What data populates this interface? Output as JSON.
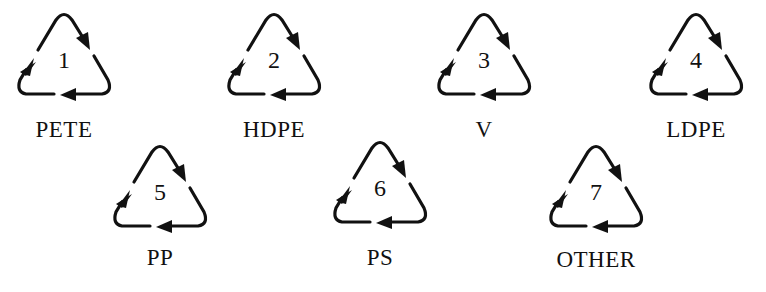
{
  "symbols": [
    {
      "number": "1",
      "label": "PETE"
    },
    {
      "number": "2",
      "label": "HDPE"
    },
    {
      "number": "3",
      "label": "V"
    },
    {
      "number": "4",
      "label": "LDPE"
    },
    {
      "number": "5",
      "label": "PP"
    },
    {
      "number": "6",
      "label": "PS"
    },
    {
      "number": "7",
      "label": "OTHER"
    }
  ],
  "icon": "recycle-triangle-icon",
  "colors": {
    "stroke": "#111111",
    "background": "#ffffff"
  }
}
